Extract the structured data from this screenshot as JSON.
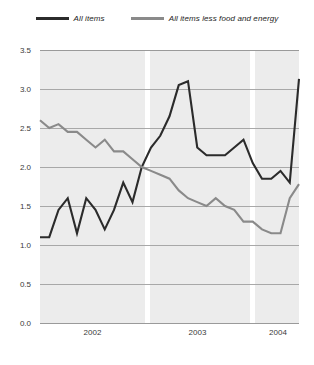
{
  "chart_data": {
    "type": "line",
    "title": "",
    "subtitle": "",
    "xlabel": "",
    "ylabel": "",
    "ylim": [
      0.0,
      3.5
    ],
    "yticks": [
      0.0,
      0.5,
      1.0,
      1.5,
      2.0,
      2.5,
      3.0,
      3.5
    ],
    "ytick_labels": [
      "0.0",
      "0.5",
      "1.0",
      "1.5",
      "2.0",
      "2.5",
      "3.0",
      "3.5"
    ],
    "xtick_labels": [
      "2002",
      "2003",
      "2004"
    ],
    "grid": true,
    "legend_position": "top-center",
    "x": [
      "2001-11",
      "2001-12",
      "2002-01",
      "2002-02",
      "2002-03",
      "2002-04",
      "2002-05",
      "2002-06",
      "2002-07",
      "2002-08",
      "2002-09",
      "2002-10",
      "2002-11",
      "2002-12",
      "2003-01",
      "2003-02",
      "2003-03",
      "2003-04",
      "2003-05",
      "2003-06",
      "2003-07",
      "2003-08",
      "2003-09",
      "2003-10",
      "2003-11",
      "2003-12",
      "2004-01",
      "2004-02",
      "2004-03"
    ],
    "series": [
      {
        "name": "All items",
        "color": "#2b2b2b",
        "values": [
          1.1,
          1.1,
          1.45,
          1.6,
          1.15,
          1.6,
          1.45,
          1.2,
          1.45,
          1.8,
          1.55,
          2.0,
          2.25,
          2.4,
          2.65,
          3.05,
          3.1,
          2.25,
          2.15,
          2.15,
          2.15,
          2.25,
          2.35,
          2.05,
          1.85,
          1.85,
          1.95,
          1.8,
          3.13
        ]
      },
      {
        "name": "All items less food and energy",
        "color": "#8a8a8a",
        "values": [
          2.6,
          2.5,
          2.55,
          2.45,
          2.45,
          2.35,
          2.25,
          2.35,
          2.2,
          2.2,
          2.1,
          2.0,
          1.95,
          1.9,
          1.85,
          1.7,
          1.6,
          1.55,
          1.5,
          1.6,
          1.5,
          1.45,
          1.3,
          1.3,
          1.2,
          1.15,
          1.15,
          1.6,
          1.78
        ]
      }
    ]
  },
  "legend": {
    "entries": [
      {
        "label": "All items",
        "color": "#2b2b2b"
      },
      {
        "label": "All items less food and energy",
        "color": "#8a8a8a"
      }
    ]
  },
  "axes": {
    "y_tick_labels": [
      "3.5",
      "3.0",
      "2.5",
      "2.0",
      "1.5",
      "1.0",
      "0.5",
      "0.0"
    ],
    "x_tick_labels": [
      "2002",
      "2003",
      "2004"
    ]
  },
  "colors": {
    "plot_background": "#ececec",
    "page_background": "#ffffff",
    "gridline": "#a8a8a8",
    "year_separator": "#ffffff",
    "series_all_items": "#2b2b2b",
    "series_core": "#8a8a8a",
    "tick_text": "#3a3a3a"
  }
}
